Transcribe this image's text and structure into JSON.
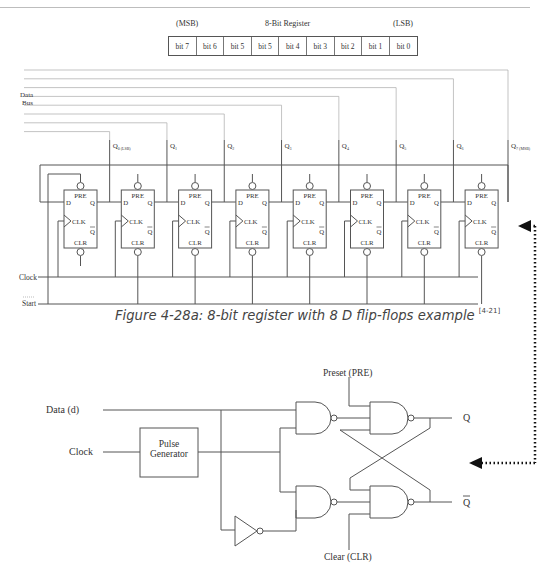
{
  "register": {
    "msb_label": "(MSB)",
    "title": "8-Bit Register",
    "lsb_label": "(LSB)",
    "cells": [
      "bit 7",
      "bit 6",
      "bit 5",
      "bit 5",
      "bit 4",
      "bit 3",
      "bit 2",
      "bit 1",
      "bit 0"
    ]
  },
  "flipflop_circuit": {
    "data_bus_label_1": "Data",
    "data_bus_label_2": "Bus",
    "clock_label": "Clock",
    "start_label": "Start",
    "outputs": [
      {
        "label": "Q",
        "sub": "0 (LSB)"
      },
      {
        "label": "Q",
        "sub": "1"
      },
      {
        "label": "Q",
        "sub": "2"
      },
      {
        "label": "Q",
        "sub": "3"
      },
      {
        "label": "Q",
        "sub": "4"
      },
      {
        "label": "Q",
        "sub": "5"
      },
      {
        "label": "Q",
        "sub": "6"
      },
      {
        "label": "Q",
        "sub": "7 (MSB)"
      }
    ],
    "ff_pins": {
      "pre": "PRE",
      "d": "D",
      "q": "Q",
      "clk": "CLK",
      "qbar": "Q",
      "clr": "CLR"
    }
  },
  "caption": {
    "text": "Figure 4-28a: 8-bit register with 8 D flip-flops example ",
    "ref": "[4-21]"
  },
  "latch_circuit": {
    "data_label": "Data (d)",
    "clock_label": "Clock",
    "pulse_gen_line1": "Pulse",
    "pulse_gen_line2": "Generator",
    "preset_label": "Preset (PRE)",
    "clear_label": "Clear (CLR)",
    "q_label": "Q",
    "qbar_label": "Q"
  },
  "colors": {
    "line": "#555555",
    "bus_line": "#aaaaaa",
    "arrow": "#111111"
  }
}
